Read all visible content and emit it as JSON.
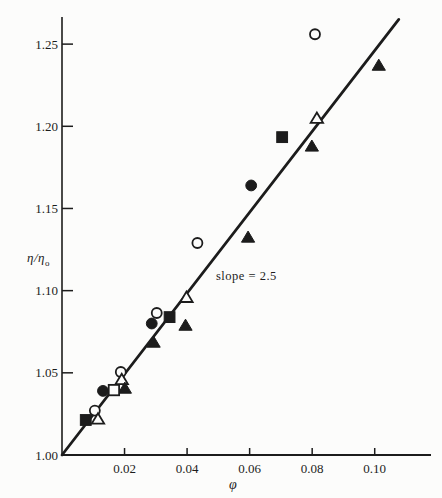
{
  "chart_data": {
    "type": "scatter",
    "title": "",
    "xlabel": "φ",
    "ylabel_main": "η/η",
    "ylabel_sub": "o",
    "annotation": "slope = 2.5",
    "xlim": [
      0,
      0.118
    ],
    "ylim": [
      1.0,
      1.2665
    ],
    "grid": false,
    "legend": "none",
    "x_ticks": [
      {
        "value": 0.02,
        "label": "0.02"
      },
      {
        "value": 0.04,
        "label": "0.04"
      },
      {
        "value": 0.06,
        "label": "0.06"
      },
      {
        "value": 0.08,
        "label": "0.08"
      },
      {
        "value": 0.1,
        "label": "0.10"
      }
    ],
    "y_ticks": [
      {
        "value": 1.0,
        "label": "1.00",
        "dash": false
      },
      {
        "value": 1.05,
        "label": "1.05",
        "dash": true
      },
      {
        "value": 1.1,
        "label": "1.10",
        "dash": true
      },
      {
        "value": 1.15,
        "label": "1.15",
        "dash": true
      },
      {
        "value": 1.2,
        "label": "1.20",
        "dash": true
      },
      {
        "value": 1.25,
        "label": "1.25",
        "dash": true
      }
    ],
    "fit_line": {
      "x1": 0,
      "y1": 1.0,
      "x2": 0.1077,
      "y2": 1.265,
      "slope": 2.5
    },
    "series": [
      {
        "name": "open-circle",
        "marker": "circle",
        "fill": "open",
        "points": [
          [
            0.0105,
            1.027
          ],
          [
            0.0188,
            1.0505
          ],
          [
            0.0303,
            1.0864
          ],
          [
            0.0433,
            1.129
          ],
          [
            0.0809,
            1.256
          ]
        ]
      },
      {
        "name": "filled-circle",
        "marker": "circle",
        "fill": "solid",
        "points": [
          [
            0.0131,
            1.039
          ],
          [
            0.0287,
            1.08
          ],
          [
            0.0605,
            1.164
          ]
        ]
      },
      {
        "name": "open-triangle",
        "marker": "triangle",
        "fill": "open",
        "points": [
          [
            0.0115,
            1.022
          ],
          [
            0.0191,
            1.046
          ],
          [
            0.0398,
            1.096
          ],
          [
            0.0815,
            1.205
          ]
        ]
      },
      {
        "name": "filled-triangle",
        "marker": "triangle",
        "fill": "solid",
        "points": [
          [
            0.0201,
            1.0407
          ],
          [
            0.0293,
            1.0687
          ],
          [
            0.0395,
            1.079
          ],
          [
            0.0595,
            1.1326
          ],
          [
            0.0799,
            1.188
          ],
          [
            0.1013,
            1.2372
          ]
        ]
      },
      {
        "name": "filled-square",
        "marker": "square",
        "fill": "solid",
        "points": [
          [
            0.0076,
            1.0213
          ],
          [
            0.0344,
            1.0839
          ],
          [
            0.0704,
            1.1934
          ]
        ]
      },
      {
        "name": "open-square",
        "marker": "square",
        "fill": "open",
        "points": [
          [
            0.0166,
            1.0395
          ]
        ]
      }
    ],
    "colors": {
      "ink": "#1c1c1c",
      "background": "#fcfcfb"
    }
  }
}
